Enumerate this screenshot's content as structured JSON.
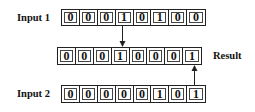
{
  "diagram": {
    "input1": {
      "label": "Input 1",
      "bits": [
        "0",
        "0",
        "0",
        "1",
        "0",
        "1",
        "0",
        "0"
      ]
    },
    "result": {
      "label": "Result",
      "bits": [
        "0",
        "0",
        "0",
        "1",
        "0",
        "0",
        "0",
        "1"
      ]
    },
    "input2": {
      "label": "Input 2",
      "bits": [
        "0",
        "0",
        "0",
        "0",
        "0",
        "1",
        "0",
        "1"
      ]
    },
    "arrows": [
      {
        "from": "input1",
        "to": "result",
        "bit_index": 3,
        "direction": "down"
      },
      {
        "from": "input2",
        "to": "result",
        "bit_index": 7,
        "direction": "up"
      }
    ],
    "colors": {
      "stroke": "#222222",
      "text": "#111111",
      "background": "#ffffff"
    }
  }
}
